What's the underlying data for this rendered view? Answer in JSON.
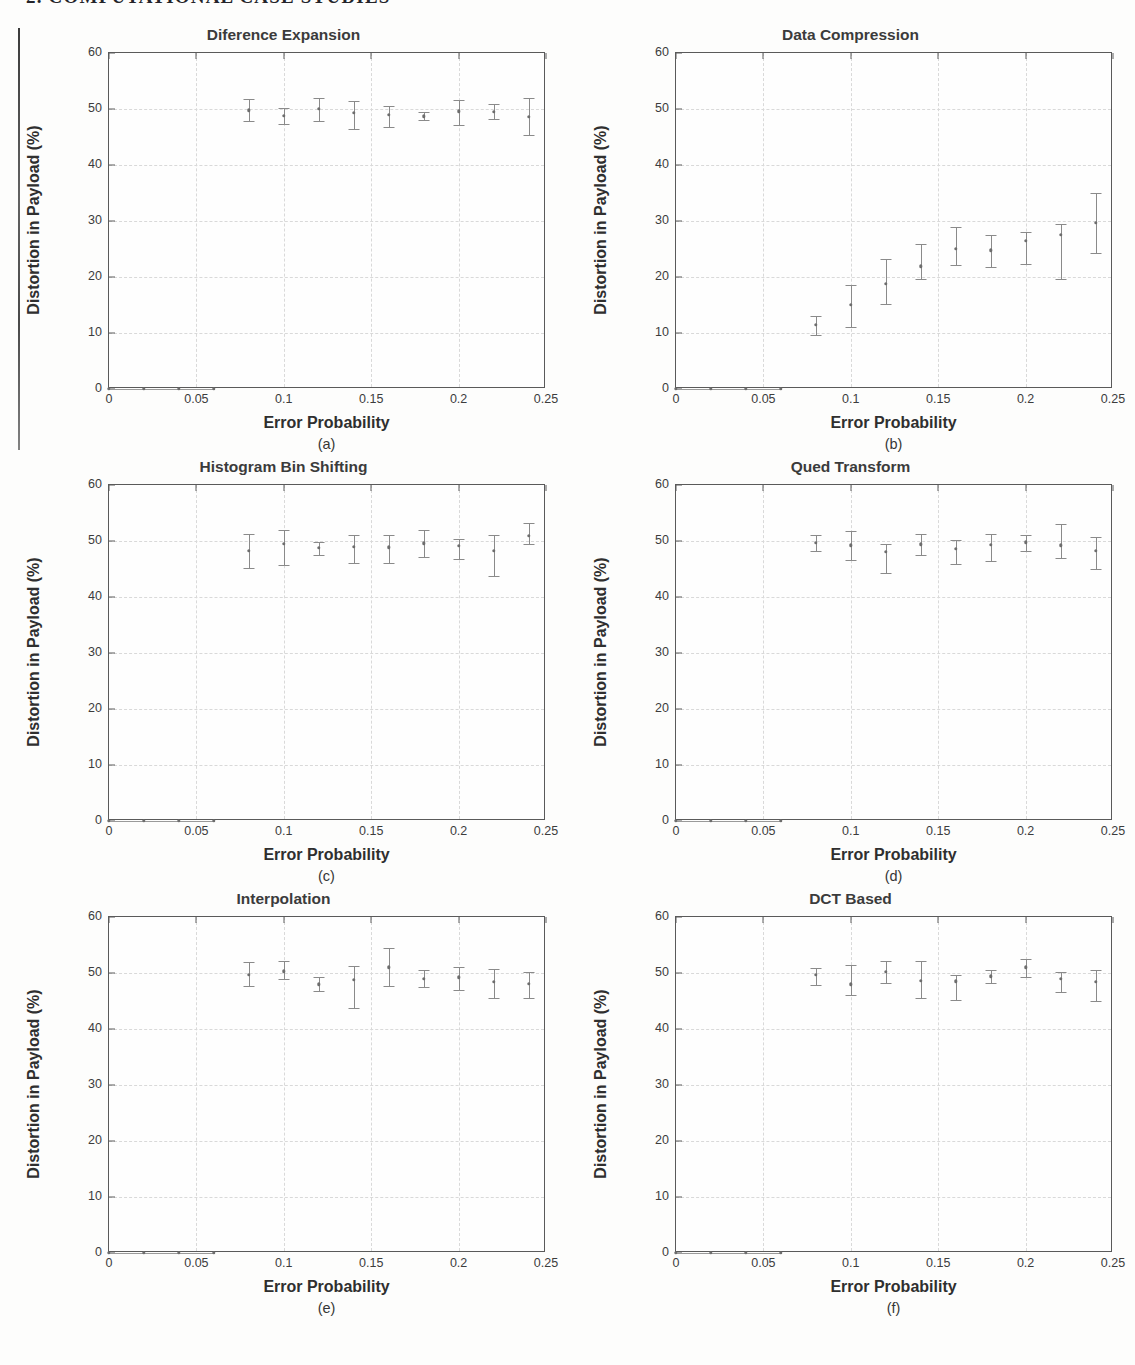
{
  "page": {
    "running_header": "2.  COMPUTATIONAL CASE STUDIES"
  },
  "axis": {
    "xlabel": "Error Probability",
    "ylabel": "Distortion in Payload (%)",
    "yticks": [
      "0",
      "10",
      "20",
      "30",
      "40",
      "50",
      "60"
    ],
    "xticks": [
      "0",
      "0.05",
      "0.1",
      "0.15",
      "0.2",
      "0.25"
    ],
    "xlim": [
      0,
      0.25
    ],
    "ylim": [
      0,
      60
    ]
  },
  "captions": {
    "a": "(a)",
    "b": "(b)",
    "c": "(c)",
    "d": "(d)",
    "e": "(e)",
    "f": "(f)"
  },
  "chart_data": [
    {
      "id": "a",
      "type": "scatter",
      "title": "Diference Expansion",
      "caption": "(a)",
      "xlabel": "Error Probability",
      "ylabel": "Distortion in Payload (%)",
      "xlim": [
        0,
        0.25
      ],
      "ylim": [
        0,
        60
      ],
      "xticks": [
        0,
        0.05,
        0.1,
        0.15,
        0.2,
        0.25
      ],
      "yticks": [
        0,
        10,
        20,
        30,
        40,
        50,
        60
      ],
      "grid": true,
      "legend": "none",
      "x": [
        0,
        0.02,
        0.04,
        0.06,
        0.08,
        0.1,
        0.12,
        0.14,
        0.16,
        0.18,
        0.2,
        0.22,
        0.24
      ],
      "y": [
        0,
        0,
        0,
        0,
        49.8,
        48.8,
        50.0,
        49.3,
        49.0,
        48.7,
        49.6,
        49.5,
        48.6
      ],
      "yerr_low": [
        0,
        0,
        0,
        0,
        2.0,
        1.5,
        2.2,
        2.8,
        2.2,
        0.7,
        2.4,
        1.3,
        3.2
      ],
      "yerr_high": [
        0,
        0,
        0,
        0,
        2.0,
        1.4,
        2.0,
        2.2,
        1.5,
        0.7,
        2.0,
        1.4,
        3.3
      ]
    },
    {
      "id": "b",
      "type": "scatter",
      "title": "Data Compression",
      "caption": "(b)",
      "xlabel": "Error Probability",
      "ylabel": "Distortion in Payload (%)",
      "xlim": [
        0,
        0.25
      ],
      "ylim": [
        0,
        60
      ],
      "xticks": [
        0,
        0.05,
        0.1,
        0.15,
        0.2,
        0.25
      ],
      "yticks": [
        0,
        10,
        20,
        30,
        40,
        50,
        60
      ],
      "grid": true,
      "legend": "none",
      "x": [
        0,
        0.02,
        0.04,
        0.06,
        0.08,
        0.1,
        0.12,
        0.14,
        0.16,
        0.18,
        0.2,
        0.22,
        0.24
      ],
      "y": [
        0,
        0,
        0,
        0,
        11.5,
        15.0,
        18.8,
        21.9,
        25.0,
        24.8,
        26.5,
        27.5,
        29.7
      ],
      "yerr_low": [
        0,
        0,
        0,
        0,
        1.8,
        4.0,
        3.6,
        2.3,
        2.9,
        3.1,
        4.2,
        7.8,
        5.5
      ],
      "yerr_high": [
        0,
        0,
        0,
        0,
        1.6,
        3.6,
        4.5,
        4.0,
        4.0,
        2.7,
        1.6,
        2.0,
        5.3
      ]
    },
    {
      "id": "c",
      "type": "scatter",
      "title": "Histogram Bin Shifting",
      "caption": "(c)",
      "xlabel": "Error Probability",
      "ylabel": "Distortion in Payload (%)",
      "xlim": [
        0,
        0.25
      ],
      "ylim": [
        0,
        60
      ],
      "xticks": [
        0,
        0.05,
        0.1,
        0.15,
        0.2,
        0.25
      ],
      "yticks": [
        0,
        10,
        20,
        30,
        40,
        50,
        60
      ],
      "grid": true,
      "legend": "none",
      "x": [
        0,
        0.02,
        0.04,
        0.06,
        0.08,
        0.1,
        0.12,
        0.14,
        0.16,
        0.18,
        0.2,
        0.22,
        0.24
      ],
      "y": [
        0,
        0,
        0,
        0,
        48.2,
        49.5,
        48.8,
        49.0,
        48.9,
        49.6,
        49.1,
        48.2,
        50.9
      ],
      "yerr_low": [
        0,
        0,
        0,
        0,
        3.0,
        3.8,
        1.3,
        3.0,
        2.9,
        2.5,
        2.4,
        4.5,
        1.5
      ],
      "yerr_high": [
        0,
        0,
        0,
        0,
        3.0,
        2.5,
        1.0,
        2.1,
        2.2,
        2.3,
        1.2,
        2.8,
        2.3
      ]
    },
    {
      "id": "d",
      "type": "scatter",
      "title": "Qued Transform",
      "caption": "(d)",
      "xlabel": "Error Probability",
      "ylabel": "Distortion in Payload (%)",
      "xlim": [
        0,
        0.25
      ],
      "ylim": [
        0,
        60
      ],
      "xticks": [
        0,
        0.05,
        0.1,
        0.15,
        0.2,
        0.25
      ],
      "yticks": [
        0,
        10,
        20,
        30,
        40,
        50,
        60
      ],
      "grid": true,
      "legend": "none",
      "x": [
        0,
        0.02,
        0.04,
        0.06,
        0.08,
        0.1,
        0.12,
        0.14,
        0.16,
        0.18,
        0.2,
        0.22,
        0.24
      ],
      "y": [
        0,
        0,
        0,
        0,
        49.7,
        49.2,
        48.1,
        49.4,
        48.6,
        49.3,
        49.8,
        49.2,
        48.2
      ],
      "yerr_low": [
        0,
        0,
        0,
        0,
        1.5,
        2.6,
        3.9,
        1.9,
        2.7,
        2.9,
        1.5,
        2.3,
        3.2
      ],
      "yerr_high": [
        0,
        0,
        0,
        0,
        1.4,
        2.6,
        1.3,
        1.8,
        1.6,
        1.9,
        1.3,
        3.8,
        2.6
      ]
    },
    {
      "id": "e",
      "type": "scatter",
      "title": "Interpolation",
      "caption": "(e)",
      "xlabel": "Error Probability",
      "ylabel": "Distortion in Payload (%)",
      "xlim": [
        0,
        0.25
      ],
      "ylim": [
        0,
        60
      ],
      "xticks": [
        0,
        0.05,
        0.1,
        0.15,
        0.2,
        0.25
      ],
      "yticks": [
        0,
        10,
        20,
        30,
        40,
        50,
        60
      ],
      "grid": true,
      "legend": "none",
      "x": [
        0,
        0.02,
        0.04,
        0.06,
        0.08,
        0.1,
        0.12,
        0.14,
        0.16,
        0.18,
        0.2,
        0.22,
        0.24
      ],
      "y": [
        0,
        0,
        0,
        0,
        49.7,
        50.3,
        48.0,
        48.8,
        51.0,
        49.0,
        49.2,
        48.4,
        48.1
      ],
      "yerr_low": [
        0,
        0,
        0,
        0,
        2.0,
        1.3,
        1.2,
        5.0,
        3.4,
        1.5,
        2.2,
        2.8,
        2.6
      ],
      "yerr_high": [
        0,
        0,
        0,
        0,
        2.2,
        1.8,
        1.2,
        2.4,
        3.4,
        1.6,
        1.9,
        2.3,
        2.0
      ]
    },
    {
      "id": "f",
      "type": "scatter",
      "title": "DCT Based",
      "caption": "(f)",
      "xlabel": "Error Probability",
      "ylabel": "Distortion in Payload (%)",
      "xlim": [
        0,
        0.25
      ],
      "ylim": [
        0,
        60
      ],
      "xticks": [
        0,
        0.05,
        0.1,
        0.15,
        0.2,
        0.25
      ],
      "yticks": [
        0,
        10,
        20,
        30,
        40,
        50,
        60
      ],
      "grid": true,
      "legend": "none",
      "x": [
        0,
        0.02,
        0.04,
        0.06,
        0.08,
        0.1,
        0.12,
        0.14,
        0.16,
        0.18,
        0.2,
        0.22,
        0.24
      ],
      "y": [
        0,
        0,
        0,
        0,
        49.7,
        48.0,
        50.2,
        48.6,
        48.5,
        49.4,
        51.0,
        49.0,
        48.4
      ],
      "yerr_low": [
        0,
        0,
        0,
        0,
        1.9,
        2.0,
        2.0,
        3.1,
        3.4,
        1.2,
        1.7,
        2.4,
        3.4
      ],
      "yerr_high": [
        0,
        0,
        0,
        0,
        1.2,
        3.5,
        2.0,
        3.6,
        1.2,
        1.2,
        1.5,
        1.2,
        2.2
      ]
    }
  ]
}
